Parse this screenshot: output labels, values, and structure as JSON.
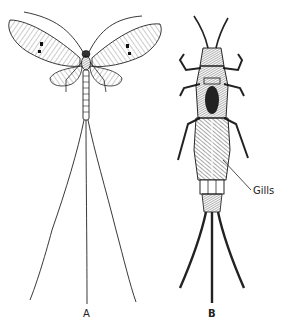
{
  "figure": {
    "type": "biological-illustration",
    "style": "black-and-white pen line drawing",
    "background": "#ffffff",
    "ink_color": "#1a1a1a",
    "panels": [
      {
        "id": "A",
        "label": "A",
        "subject": "adult winged insect with two pairs of veined wings, long antennae, segmented abdomen and three long tail filaments"
      },
      {
        "id": "B",
        "label": "B",
        "subject": "aquatic nymph with antennae, six legs, feathery abdominal gills and three hairy tail filaments"
      }
    ],
    "annotations": [
      {
        "text": "Gills",
        "points_to": "abdomen of nymph B"
      }
    ]
  },
  "labels": {
    "a": "A",
    "b": "B",
    "gills": "Gills"
  }
}
